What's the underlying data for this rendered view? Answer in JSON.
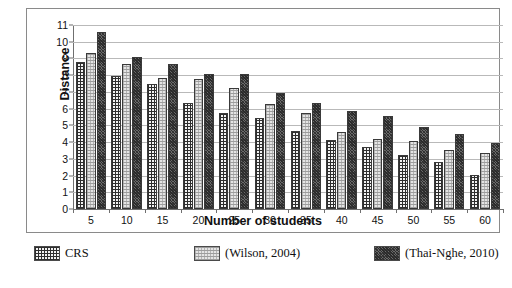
{
  "chart_data": {
    "type": "bar",
    "title": "",
    "xlabel": "Number of students",
    "ylabel": "Distance",
    "categories": [
      "5",
      "10",
      "15",
      "20",
      "25",
      "30",
      "35",
      "40",
      "45",
      "50",
      "55",
      "60"
    ],
    "ylim": [
      0,
      11
    ],
    "yticks": [
      "0",
      "1",
      "2",
      "3",
      "4",
      "5",
      "6",
      "7",
      "8",
      "9",
      "10",
      "11"
    ],
    "grid": true,
    "legend_position": "bottom",
    "series": [
      {
        "name": "CRS",
        "pattern": "brick-grid-dark",
        "color": "#3a3a3a",
        "values": [
          8.8,
          7.95,
          7.5,
          6.35,
          5.75,
          5.45,
          4.65,
          4.1,
          3.7,
          3.25,
          2.8,
          2.05
        ]
      },
      {
        "name": "(Wilson, 2004)",
        "pattern": "light-dotted",
        "color": "#e4e4e4",
        "values": [
          9.3,
          8.65,
          7.85,
          7.8,
          7.25,
          6.25,
          5.75,
          4.6,
          4.2,
          4.05,
          3.55,
          3.35
        ]
      },
      {
        "name": "(Thai-Nghe, 2010)",
        "pattern": "dense-dark-cross",
        "color": "#6a6a6a",
        "values": [
          10.6,
          9.1,
          8.65,
          8.1,
          8.05,
          6.95,
          6.35,
          5.85,
          5.55,
          4.9,
          4.5,
          3.95
        ]
      }
    ]
  },
  "legend": {
    "items": [
      {
        "label": "CRS"
      },
      {
        "label": "(Wilson, 2004)"
      },
      {
        "label": "(Thai-Nghe, 2010)"
      }
    ]
  }
}
